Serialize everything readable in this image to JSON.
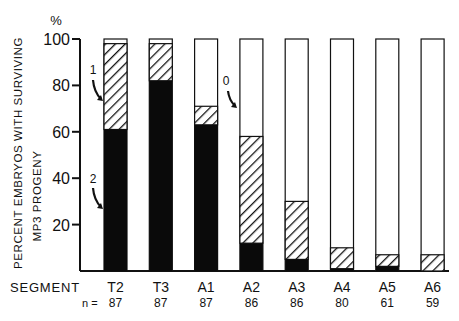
{
  "chart_data": {
    "type": "bar",
    "stacked": true,
    "title": "",
    "ylabel_line1": "PERCENT EMBRYOS WITH SURVIVING",
    "ylabel_line2": "MP3 PROGENY",
    "yunit": "%",
    "xlabel": "SEGMENT",
    "n_label": "n =",
    "ylim": [
      0,
      100
    ],
    "yticks": [
      20,
      40,
      60,
      80,
      100
    ],
    "categories": [
      "T2",
      "T3",
      "A1",
      "A2",
      "A3",
      "A4",
      "A5",
      "A6"
    ],
    "n": [
      87,
      87,
      87,
      86,
      86,
      80,
      61,
      59
    ],
    "series": [
      {
        "name": "2",
        "fill": "solid black",
        "values": [
          61,
          82,
          63,
          12,
          5,
          1,
          2,
          0
        ]
      },
      {
        "name": "1",
        "fill": "hatched",
        "values": [
          37,
          16,
          8,
          46,
          25,
          9,
          5,
          7
        ]
      },
      {
        "name": "0",
        "fill": "white",
        "values": [
          2,
          2,
          29,
          42,
          70,
          90,
          93,
          93
        ]
      }
    ],
    "cumulative_tops": {
      "black": [
        61,
        82,
        63,
        12,
        5,
        1,
        2,
        0
      ],
      "hatched": [
        98,
        98,
        71,
        58,
        30,
        10,
        7,
        7
      ]
    },
    "annotations": [
      {
        "text": "1",
        "target": "T2 hatched region"
      },
      {
        "text": "2",
        "target": "T2 black region"
      },
      {
        "text": "0",
        "target": "A2 white region"
      }
    ],
    "grid": false,
    "legend": "none (arrow annotations)"
  }
}
